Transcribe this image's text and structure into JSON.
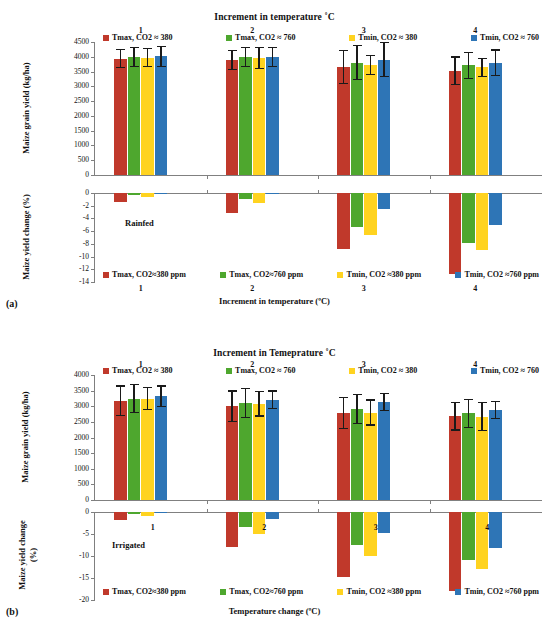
{
  "figure": {
    "panels": [
      {
        "letter": "(a)",
        "condition": "Rainfed",
        "top_title": "Increment in temperature ˚C",
        "bottom_axis_title": "Increment in temperature (ºC)",
        "yield_axis_title": "Maize grain yield (kg/ha)",
        "change_axis_title_line1": "Maize yield change (%)",
        "yield_ticks": [
          "4500",
          "4000",
          "3500",
          "3000",
          "2500",
          "2000",
          "1500",
          "1000",
          "500",
          "0"
        ],
        "change_ticks": [
          "0",
          "-2",
          "-4",
          "-6",
          "-8",
          "-10",
          "-12",
          "-14"
        ],
        "group_numbers": [
          "1",
          "2",
          "3",
          "4"
        ],
        "xtick_labels": [
          "1",
          "2",
          "3",
          "4"
        ],
        "legend_top": [
          {
            "label": "Tmax, CO2 ≈ 380",
            "color": "#C0392B"
          },
          {
            "label": "Tmax, CO2 ≈ 760",
            "color": "#4EA72E"
          },
          {
            "label": "Tmin, CO2 ≈ 380",
            "color": "#FFD320"
          },
          {
            "label": "Tmin, CO2 ≈ 760",
            "color": "#2E75B6"
          }
        ],
        "legend_bottom": [
          {
            "label": "Tmax, CO2≈380 ppm",
            "color": "#C0392B"
          },
          {
            "label": "Tmax, CO2≈760 ppm",
            "color": "#4EA72E"
          },
          {
            "label": "Tmin, CO2 ≈380 ppm",
            "color": "#FFD320"
          },
          {
            "label": "Tmin, CO2 ≈760 ppm",
            "color": "#2E75B6"
          }
        ]
      },
      {
        "letter": "(b)",
        "condition": "Irrigated",
        "top_title": "Increment in Temeprature ˚C",
        "bottom_axis_title": "Temperature change (ºC)",
        "yield_axis_title": "Maize grain yield (kg/ha)",
        "change_axis_title_line1": "Maize yield change",
        "change_axis_title_line2": "(%)",
        "yield_ticks": [
          "4000",
          "3500",
          "3000",
          "2500",
          "2000",
          "1500",
          "1000",
          "500",
          "0"
        ],
        "change_ticks": [
          "0",
          "-5",
          "-10",
          "-15",
          "-20"
        ],
        "group_numbers": [
          "1",
          "2",
          "3",
          "4"
        ],
        "xtick_labels": [
          "1",
          "2",
          "3",
          "4"
        ],
        "legend_top": [
          {
            "label": "Tmax, CO2 ≈ 380",
            "color": "#C0392B"
          },
          {
            "label": "Tmax, CO2 ≈ 760",
            "color": "#4EA72E"
          },
          {
            "label": "Tmin, CO2 ≈ 380",
            "color": "#FFD320"
          },
          {
            "label": "Tmin, CO2 ≈ 760",
            "color": "#2E75B6"
          }
        ],
        "legend_bottom": [
          {
            "label": "Tmax, CO2≈380 ppm",
            "color": "#C0392B"
          },
          {
            "label": "Tmax, CO2≈760 ppm",
            "color": "#4EA72E"
          },
          {
            "label": "Tmin, CO2 ≈380 ppm",
            "color": "#FFD320"
          },
          {
            "label": "Tmin, CO2 ≈760 ppm",
            "color": "#2E75B6"
          }
        ]
      }
    ]
  },
  "chart_data": [
    {
      "type": "bar",
      "id": "a-yield",
      "title": "Increment in temperature ˚C",
      "subtitle": "Rainfed — Maize grain yield",
      "xlabel": "Increment in temperature (ºC)",
      "ylabel": "Maize grain yield (kg/ha)",
      "ylim": [
        0,
        4500
      ],
      "ytick_step": 500,
      "grid": false,
      "legend_position": "top",
      "categories": [
        "1",
        "2",
        "3",
        "4"
      ],
      "series": [
        {
          "name": "Tmax, CO2 ≈ 380",
          "color": "#C0392B",
          "values": [
            3940,
            3890,
            3650,
            3520
          ],
          "errors": [
            330,
            350,
            580,
            490
          ]
        },
        {
          "name": "Tmax, CO2 ≈ 760",
          "color": "#4EA72E",
          "values": [
            3990,
            3985,
            3800,
            3705
          ],
          "errors": [
            350,
            340,
            590,
            460
          ]
        },
        {
          "name": "Tmin, CO2 ≈ 380",
          "color": "#FFD320",
          "values": [
            3970,
            3960,
            3725,
            3640
          ],
          "errors": [
            330,
            370,
            340,
            330
          ]
        },
        {
          "name": "Tmin, CO2 ≈ 760",
          "color": "#2E75B6",
          "values": [
            4010,
            4000,
            3905,
            3800
          ],
          "errors": [
            350,
            340,
            590,
            450
          ]
        }
      ]
    },
    {
      "type": "bar",
      "id": "a-change",
      "subtitle": "Rainfed — Maize yield change",
      "xlabel": "Increment in temperature (ºC)",
      "ylabel": "Maize yield change (%)",
      "ylim": [
        -14,
        0
      ],
      "ytick_step": 2,
      "grid": false,
      "legend_position": "bottom",
      "categories": [
        "1",
        "2",
        "3",
        "4"
      ],
      "series": [
        {
          "name": "Tmax, CO2≈380 ppm",
          "color": "#C0392B",
          "values": [
            -1.4,
            -3.1,
            -8.8,
            -12.8
          ]
        },
        {
          "name": "Tmax, CO2≈760 ppm",
          "color": "#4EA72E",
          "values": [
            -0.3,
            -0.9,
            -5.4,
            -7.8
          ]
        },
        {
          "name": "Tmin, CO2 ≈380 ppm",
          "color": "#FFD320",
          "values": [
            -0.6,
            -1.5,
            -6.6,
            -8.9
          ]
        },
        {
          "name": "Tmin, CO2 ≈760 ppm",
          "color": "#2E75B6",
          "values": [
            -0.1,
            -0.15,
            -2.5,
            -5.0
          ]
        }
      ]
    },
    {
      "type": "bar",
      "id": "b-yield",
      "title": "Increment in Temeprature ˚C",
      "subtitle": "Irrigated — Maize grain yield",
      "xlabel": "Temperature change (ºC)",
      "ylabel": "Maize grain yield (kg/ha)",
      "ylim": [
        0,
        4000
      ],
      "ytick_step": 500,
      "grid": false,
      "legend_position": "top",
      "categories": [
        "1",
        "2",
        "3",
        "4"
      ],
      "series": [
        {
          "name": "Tmax, CO2 ≈ 380",
          "color": "#C0392B",
          "values": [
            3180,
            3000,
            2780,
            2680
          ],
          "errors": [
            490,
            510,
            510,
            460
          ]
        },
        {
          "name": "Tmax, CO2 ≈ 760",
          "color": "#4EA72E",
          "values": [
            3240,
            3110,
            2910,
            2770
          ],
          "errors": [
            470,
            490,
            480,
            470
          ]
        },
        {
          "name": "Tmin, CO2 ≈ 380",
          "color": "#FFD320",
          "values": [
            3240,
            3080,
            2800,
            2670
          ],
          "errors": [
            370,
            410,
            420,
            460
          ]
        },
        {
          "name": "Tmin, CO2 ≈ 760",
          "color": "#2E75B6",
          "values": [
            3320,
            3210,
            3140,
            2890
          ],
          "errors": [
            350,
            300,
            290,
            290
          ]
        }
      ]
    },
    {
      "type": "bar",
      "id": "b-change",
      "subtitle": "Irrigated — Maize yield change",
      "xlabel": "Temperature change (ºC)",
      "ylabel": "Maize yield change (%)",
      "ylim": [
        -20,
        0
      ],
      "ytick_step": 5,
      "grid": false,
      "legend_position": "bottom",
      "categories": [
        "1",
        "2",
        "3",
        "4"
      ],
      "series": [
        {
          "name": "Tmax, CO2≈380 ppm",
          "color": "#C0392B",
          "values": [
            -1.8,
            -8.0,
            -14.8,
            -18.0
          ]
        },
        {
          "name": "Tmax, CO2≈760 ppm",
          "color": "#4EA72E",
          "values": [
            -0.5,
            -3.4,
            -7.6,
            -10.9
          ]
        },
        {
          "name": "Tmin, CO2 ≈380 ppm",
          "color": "#FFD320",
          "values": [
            -0.8,
            -4.9,
            -10.0,
            -12.9
          ]
        },
        {
          "name": "Tmin, CO2 ≈760 ppm",
          "color": "#2E75B6",
          "values": [
            -0.2,
            -1.7,
            -4.8,
            -8.2
          ]
        }
      ]
    }
  ]
}
